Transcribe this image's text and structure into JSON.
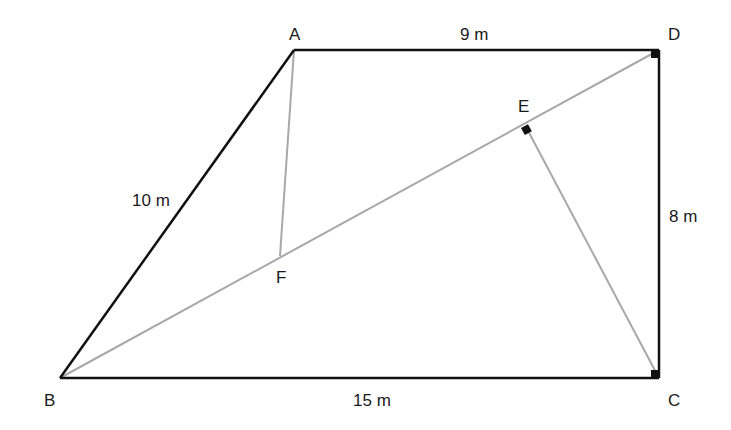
{
  "diagram": {
    "type": "geometry-trapezoid",
    "colors": {
      "edge": "#111111",
      "construction": "#a8a8a8",
      "right_angle_marker": "#111111",
      "background": "#ffffff"
    },
    "points": {
      "A": {
        "label": "A",
        "x": 294,
        "y": 50
      },
      "D": {
        "label": "D",
        "x": 659,
        "y": 50
      },
      "C": {
        "label": "C",
        "x": 659,
        "y": 378
      },
      "B": {
        "label": "B",
        "x": 60,
        "y": 378
      },
      "E": {
        "label": "E",
        "x": 524,
        "y": 128
      },
      "F": {
        "label": "F",
        "x": 280,
        "y": 256
      }
    },
    "edges": [
      {
        "from": "A",
        "to": "D",
        "style": "solid"
      },
      {
        "from": "D",
        "to": "C",
        "style": "solid"
      },
      {
        "from": "C",
        "to": "B",
        "style": "solid"
      },
      {
        "from": "B",
        "to": "A",
        "style": "solid"
      },
      {
        "from": "B",
        "to": "D",
        "style": "construction"
      },
      {
        "from": "A",
        "to": "F",
        "style": "construction"
      },
      {
        "from": "C",
        "to": "E",
        "style": "construction"
      }
    ],
    "measurements": {
      "AD": "9 m",
      "AB": "10 m",
      "DC": "8 m",
      "BC": "15 m"
    },
    "right_angles": [
      "D",
      "C",
      "E"
    ]
  }
}
